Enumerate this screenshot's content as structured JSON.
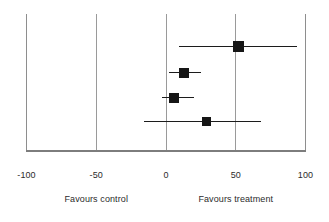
{
  "chart_data": {
    "type": "scatter",
    "subtype": "forest-plot",
    "title": "",
    "xlabel": "",
    "ylabel": "",
    "xlim": [
      -100,
      100
    ],
    "xticks": [
      -100,
      -50,
      0,
      50,
      100
    ],
    "xtick_labels": [
      "-100",
      "-50",
      "0",
      "50",
      "100"
    ],
    "grid": true,
    "gridlines_x": [
      -100,
      -50,
      0,
      50,
      100
    ],
    "null_line": 0,
    "legend": "none",
    "annotations": [
      {
        "text": "Favours control",
        "x": -50
      },
      {
        "text": "Favours treatment",
        "x": 50
      }
    ],
    "series": [
      {
        "name": "study-1",
        "estimate": 52,
        "ci_low": 9,
        "ci_high": 94,
        "row": 1
      },
      {
        "name": "study-2",
        "estimate": 13,
        "ci_low": 2,
        "ci_high": 25,
        "row": 2
      },
      {
        "name": "study-3",
        "estimate": 6,
        "ci_low": -3,
        "ci_high": 20,
        "row": 3
      },
      {
        "name": "study-4",
        "estimate": 29,
        "ci_low": -16,
        "ci_high": 68,
        "row": 4
      }
    ]
  },
  "axis": {
    "ticks": [
      {
        "label": "-100",
        "value": -100
      },
      {
        "label": "-50",
        "value": -50
      },
      {
        "label": "0",
        "value": 0
      },
      {
        "label": "50",
        "value": 50
      },
      {
        "label": "100",
        "value": 100
      }
    ]
  },
  "captions": {
    "left": "Favours control",
    "right": "Favours treatment"
  },
  "colors": {
    "marker": "#161616",
    "ci_line": "#1c1c1c",
    "gridline": "#9a9a9a",
    "baseline": "#7d7d7d",
    "text": "#2b2b2b",
    "background": "#ffffff"
  }
}
